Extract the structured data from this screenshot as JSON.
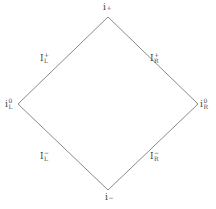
{
  "diagram": {
    "type": "penrose-diagram",
    "line_color": "#8a8a8a",
    "vertices": {
      "top": {
        "x": 108,
        "y": 17
      },
      "left": {
        "x": 18,
        "y": 104
      },
      "right": {
        "x": 198,
        "y": 104
      },
      "bottom": {
        "x": 108,
        "y": 190
      }
    },
    "labels": {
      "top": {
        "base": "i",
        "sup": "+",
        "sub": ""
      },
      "left": {
        "base": "i",
        "sup": "0",
        "sub": "L"
      },
      "right": {
        "base": "i",
        "sup": "0",
        "sub": "R"
      },
      "bottom": {
        "base": "i",
        "sup": "−",
        "sub": ""
      },
      "upper_left_edge": {
        "base": "I",
        "sup": "+",
        "sub": "L"
      },
      "upper_right_edge": {
        "base": "I",
        "sup": "+",
        "sub": "R"
      },
      "lower_left_edge": {
        "base": "I",
        "sup": "−",
        "sub": "L"
      },
      "lower_right_edge": {
        "base": "I",
        "sup": "−",
        "sub": "R"
      }
    }
  }
}
